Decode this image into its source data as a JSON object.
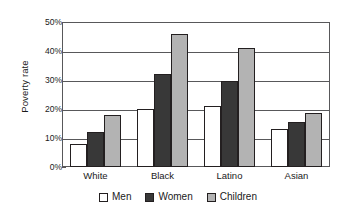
{
  "chart_data": {
    "type": "bar",
    "title": "",
    "xlabel": "",
    "ylabel": "Poverty rate",
    "ylim": [
      0,
      50
    ],
    "ytick_labels": [
      "50%",
      "40%",
      "30%",
      "20%",
      "10%",
      "0%"
    ],
    "ytick_values": [
      50,
      40,
      30,
      20,
      10,
      0
    ],
    "grid": true,
    "legend_position": "bottom",
    "categories": [
      "White",
      "Black",
      "Latino",
      "Asian"
    ],
    "series": [
      {
        "name": "Men",
        "color": "#ffffff",
        "values": [
          8,
          20,
          21,
          13
        ]
      },
      {
        "name": "Women",
        "color": "#383838",
        "values": [
          12,
          32,
          29.5,
          15.5
        ]
      },
      {
        "name": "Children",
        "color": "#b3b3b3",
        "values": [
          18,
          46,
          41,
          18.5
        ]
      }
    ]
  }
}
